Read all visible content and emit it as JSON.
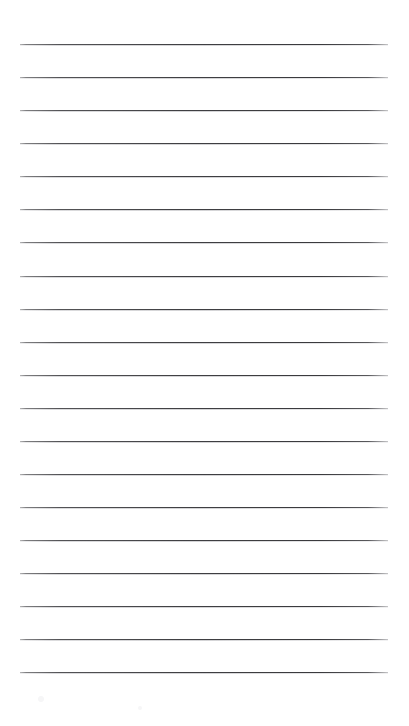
{
  "document": {
    "type": "ruled-lined-paper",
    "title": "Blank ruled notebook page",
    "page_width": 409,
    "page_height": 726,
    "background_color": "#ffffff",
    "orientation": "portrait",
    "text_content": "",
    "has_header": false,
    "has_footer": false,
    "has_margin_rule": false,
    "has_page_number": false
  },
  "ruling": {
    "line_count": 20,
    "line_color": "#4a4a4d",
    "line_halo_color": "#b0b0b4",
    "line_thickness_px": 1,
    "line_spacing_px": 33.05,
    "left_margin_px": 20,
    "right_margin_px": 21,
    "line_start_x": 20,
    "line_end_x": 388,
    "line_length_px": 368,
    "first_line_y": 44,
    "last_line_y": 672,
    "top_blank_space_px": 44,
    "bottom_blank_space_px": 54,
    "line_y_positions": [
      44,
      77,
      110,
      143,
      176,
      209,
      242,
      276,
      309,
      342,
      375,
      408,
      441,
      474,
      507,
      540,
      573,
      606,
      639,
      672
    ]
  },
  "artifacts": {
    "specks": [
      {
        "x": 38,
        "y": 696,
        "size": 6
      },
      {
        "x": 138,
        "y": 706,
        "size": 4
      }
    ]
  }
}
